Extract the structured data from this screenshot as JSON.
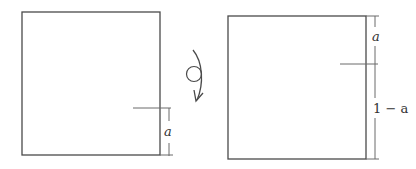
{
  "diagram": {
    "left_square": {
      "dimension_label": "a"
    },
    "rotation_symbol": {
      "icon": "rotate-clockwise-arrow-icon",
      "description": "circle with curved arrow indicating flip/rotation"
    },
    "right_square": {
      "top_segment_label": "a",
      "bottom_segment_label": "1 − a"
    },
    "colors": {
      "stroke": "#4a4a4a",
      "background": "#ffffff"
    }
  }
}
